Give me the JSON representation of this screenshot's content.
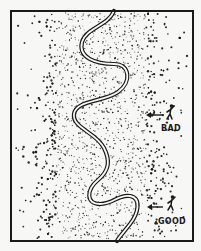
{
  "figure": {
    "background": "#f7f7f5",
    "ink": "#1a1a1a",
    "frame": {
      "x": 11,
      "y": 11,
      "w": 182,
      "h": 230,
      "stroke": 2
    },
    "band": {
      "x0": 56,
      "x1": 146,
      "feather": 22
    },
    "gap": {
      "y": 116,
      "x0": 72,
      "x1": 140,
      "h": 4
    },
    "river": {
      "path": "M114,11 C108,26 86,28 82,42 C78,58 96,64 114,64 C130,64 132,82 118,92 C104,102 76,100 74,114 C72,128 96,132 104,148 C110,160 110,170 98,180 C86,190 86,204 100,204 C114,204 118,194 130,196 C142,198 138,214 130,224 C124,232 118,238 117,241",
      "width": 4.2,
      "inner_width": 1.8
    },
    "people": [
      {
        "label": "BAD",
        "x": 170,
        "y": 111,
        "arrow_x0": 146,
        "arrow_x1": 163,
        "arrow_y": 115,
        "text_y": 131
      },
      {
        "label": "GOOD",
        "x": 171,
        "y": 202,
        "arrow_x0": 147,
        "arrow_x1": 163,
        "arrow_y": 207,
        "text_y": 224
      }
    ]
  }
}
